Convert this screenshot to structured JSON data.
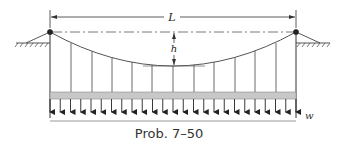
{
  "figure": {
    "caption": "Prob. 7–50",
    "labels": {
      "span": "L",
      "sag": "h",
      "load": "w"
    },
    "colors": {
      "line": "#333333",
      "cable": "#555555",
      "deck": "#c8c8c8",
      "deck_edge": "#888888",
      "hatch": "#444444"
    },
    "geometry": {
      "left_support": {
        "x": 50,
        "y": 32
      },
      "right_support": {
        "x": 296,
        "y": 32
      },
      "cable_low_point": {
        "x": 173,
        "y": 66
      },
      "deck_top": 92,
      "deck_bottom": 99,
      "arrow_bottom": 118,
      "baseline_y": 121,
      "dimension_line_y": 17,
      "hanger_count": 11,
      "arrow_count": 25
    }
  }
}
